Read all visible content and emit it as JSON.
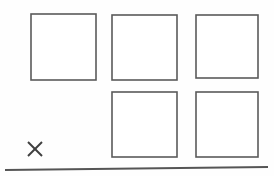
{
  "diagram": {
    "background_color": "#fefefe",
    "width": 274,
    "height": 176,
    "stroke_color": "#5a5a5a",
    "xmark_color": "#3f3f3f",
    "baseline_color": "#555555",
    "shapes": {
      "squares": [
        {
          "name": "square-row1-col1",
          "label": "",
          "x": 31,
          "y": 14,
          "w": 65,
          "h": 66
        },
        {
          "name": "square-row1-col2",
          "label": "",
          "x": 112,
          "y": 15,
          "w": 65,
          "h": 65
        },
        {
          "name": "square-row1-col3",
          "label": "",
          "x": 196,
          "y": 15,
          "w": 62,
          "h": 63
        },
        {
          "name": "square-row2-col2",
          "label": "",
          "x": 112,
          "y": 92,
          "w": 65,
          "h": 65
        },
        {
          "name": "square-row2-col3",
          "label": "",
          "x": 196,
          "y": 92,
          "w": 62,
          "h": 65
        }
      ],
      "xmark": {
        "name": "x-mark",
        "label": "X",
        "cx": 35,
        "cy": 149,
        "size": 14
      },
      "baseline": {
        "name": "baseline-rule",
        "x1": 5,
        "y1": 170,
        "x2": 268,
        "y2": 167
      }
    }
  }
}
